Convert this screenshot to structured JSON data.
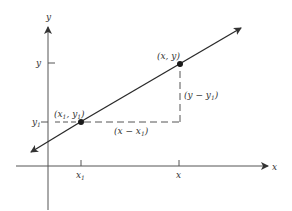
{
  "diagram": {
    "type": "point-slope line diagram",
    "colors": {
      "ink": "#2a2a2a",
      "axis": "#555555",
      "background": "#ffffff"
    },
    "axes": {
      "x_label": "x",
      "y_label": "y"
    },
    "ticks": {
      "x_ticks": [
        {
          "label": "x",
          "sub": "1"
        },
        {
          "label": "x",
          "sub": ""
        }
      ],
      "y_ticks": [
        {
          "label": "y",
          "sub": ""
        },
        {
          "label": "y",
          "sub": "1"
        }
      ]
    },
    "points": [
      {
        "name": "P1",
        "label_open": "(x",
        "label_sub1": "1",
        "label_mid": ", y",
        "label_sub2": "1",
        "label_close": ")"
      },
      {
        "name": "P",
        "label": "(x, y)"
      }
    ],
    "annotations": {
      "run": {
        "open": "(x − x",
        "sub": "1",
        "close": ")"
      },
      "rise": {
        "open": "(y − y",
        "sub": "1",
        "close": ")"
      }
    }
  }
}
